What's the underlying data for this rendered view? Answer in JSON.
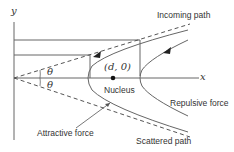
{
  "diagram": {
    "axes": {
      "x_label": "x",
      "y_label": "y"
    },
    "labels": {
      "incoming_path": "Incoming path",
      "nucleus_coord": "(d, 0)",
      "nucleus": "Nucleus",
      "repulsive_force": "Repulsive force",
      "attractive_force": "Attractive force",
      "scattered_path": "Scattered path",
      "theta_upper": "θ",
      "theta_lower": "θ"
    },
    "colors": {
      "line": "#555555",
      "text": "#333333",
      "background": "#ffffff"
    }
  }
}
